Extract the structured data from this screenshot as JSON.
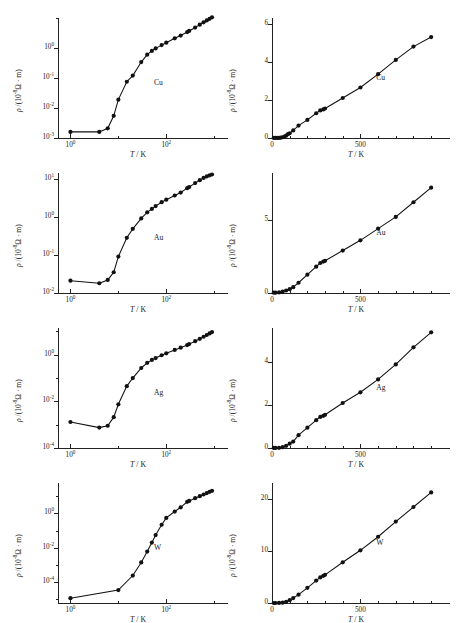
{
  "figure": {
    "caption": "",
    "panel_count": 8,
    "rows": 4,
    "columns": 2
  },
  "axis_titles": {
    "x": "T / K",
    "y_log": "ρ /(10⁻⁸Ω · m)",
    "y_linear": "ρ /(10⁻⁸Ω · m)"
  },
  "chart_data": [
    {
      "type": "line",
      "id": "cu-log",
      "title": "",
      "series_label": "Cu",
      "xlabel": "T / K",
      "ylabel": "ρ /(10⁻⁸Ω · m)",
      "xscale": "log",
      "yscale": "log",
      "xlim": [
        0.55,
        1200
      ],
      "ylim": [
        0.001,
        10
      ],
      "xticks": [
        1,
        100
      ],
      "xticklabels": [
        "10⁰",
        "10²"
      ],
      "yticks": [
        1,
        0.1,
        0.01,
        0.001
      ],
      "yticklabels": [
        "10⁰",
        "10⁻¹",
        "10⁻²",
        "10⁻³"
      ],
      "x": [
        1,
        4,
        6,
        8,
        10,
        15,
        20,
        30,
        40,
        50,
        60,
        80,
        100,
        150,
        200,
        273,
        300,
        400,
        500,
        600,
        700,
        800,
        900
      ],
      "y": [
        0.0016,
        0.0016,
        0.0021,
        0.0055,
        0.019,
        0.075,
        0.12,
        0.34,
        0.6,
        0.8,
        0.97,
        1.25,
        1.5,
        2.1,
        2.6,
        3.4,
        3.7,
        4.8,
        6.0,
        7.2,
        8.3,
        9.4,
        10.5
      ]
    },
    {
      "type": "line",
      "id": "cu-linear",
      "title": "",
      "series_label": "Cu",
      "xlabel": "T / K",
      "ylabel": "ρ /(10⁻⁸Ω · m)",
      "xscale": "linear",
      "yscale": "linear",
      "xlim": [
        0,
        950
      ],
      "ylim": [
        0,
        6.3
      ],
      "xticks": [
        0,
        100,
        200,
        300,
        400,
        500,
        600,
        700,
        800,
        900
      ],
      "xticklabels": [
        "0",
        "",
        "",
        "",
        "",
        "500",
        "",
        "",
        "",
        ""
      ],
      "yticks": [
        0,
        2,
        4,
        6
      ],
      "yticklabels": [
        "0",
        "2",
        "4",
        "6"
      ],
      "x": [
        10,
        20,
        30,
        40,
        50,
        60,
        70,
        80,
        90,
        100,
        120,
        150,
        200,
        250,
        273,
        290,
        300,
        400,
        500,
        600,
        700,
        800,
        900
      ],
      "y": [
        0.002,
        0.002,
        0.003,
        0.006,
        0.019,
        0.04,
        0.08,
        0.12,
        0.2,
        0.25,
        0.4,
        0.65,
        0.95,
        1.3,
        1.45,
        1.5,
        1.55,
        2.1,
        2.65,
        3.35,
        4.1,
        4.8,
        5.3
      ]
    },
    {
      "type": "line",
      "id": "au-log",
      "title": "",
      "series_label": "Au",
      "xlabel": "T / K",
      "ylabel": "ρ /(10⁻⁸Ω · m)",
      "xscale": "log",
      "yscale": "log",
      "xlim": [
        0.55,
        1200
      ],
      "ylim": [
        0.01,
        14
      ],
      "xticks": [
        1,
        100
      ],
      "xticklabels": [
        "10⁰",
        "10²"
      ],
      "yticks": [
        10,
        1,
        0.1,
        0.01
      ],
      "yticklabels": [
        "10¹",
        "10⁰",
        "10⁻¹",
        "10⁻²"
      ],
      "x": [
        1,
        4,
        6,
        8,
        10,
        15,
        20,
        30,
        40,
        50,
        60,
        80,
        100,
        150,
        200,
        273,
        300,
        400,
        500,
        600,
        700,
        800,
        900
      ],
      "y": [
        0.021,
        0.018,
        0.022,
        0.035,
        0.09,
        0.28,
        0.48,
        0.9,
        1.3,
        1.6,
        1.9,
        2.4,
        2.8,
        3.6,
        4.3,
        5.6,
        6.0,
        7.6,
        9.1,
        10.4,
        11.4,
        12.2,
        12.8
      ]
    },
    {
      "type": "line",
      "id": "au-linear",
      "title": "",
      "series_label": "Au",
      "xlabel": "T / K",
      "ylabel": "ρ /(10⁻⁸Ω · m)",
      "xscale": "linear",
      "yscale": "linear",
      "xlim": [
        0,
        950
      ],
      "ylim": [
        0,
        8.2
      ],
      "xticks": [
        0,
        100,
        200,
        300,
        400,
        500,
        600,
        700,
        800,
        900
      ],
      "xticklabels": [
        "0",
        "",
        "",
        "",
        "",
        "500",
        "",
        "",
        "",
        ""
      ],
      "yticks": [
        0,
        5
      ],
      "yticklabels": [
        "0",
        "5"
      ],
      "x": [
        10,
        20,
        40,
        60,
        80,
        100,
        120,
        150,
        200,
        250,
        273,
        290,
        300,
        400,
        500,
        600,
        700,
        800,
        900
      ],
      "y": [
        0.02,
        0.02,
        0.04,
        0.09,
        0.17,
        0.26,
        0.4,
        0.7,
        1.25,
        1.8,
        2.05,
        2.15,
        2.2,
        2.9,
        3.6,
        4.4,
        5.2,
        6.2,
        7.2
      ]
    },
    {
      "type": "line",
      "id": "ag-log",
      "title": "",
      "series_label": "Ag",
      "xlabel": "T / K",
      "ylabel": "ρ /(10⁻⁸Ω · m)",
      "xscale": "log",
      "yscale": "log",
      "xlim": [
        0.55,
        1200
      ],
      "ylim": [
        0.0001,
        14
      ],
      "xticks": [
        1,
        100
      ],
      "xticklabels": [
        "10⁰",
        "10²"
      ],
      "yticks": [
        1,
        0.01,
        0.0001
      ],
      "yticklabels": [
        "10⁰",
        "10⁻²",
        "10⁻⁴"
      ],
      "x": [
        1,
        4,
        6,
        8,
        10,
        15,
        20,
        30,
        40,
        50,
        60,
        80,
        100,
        150,
        200,
        273,
        300,
        400,
        500,
        600,
        700,
        800,
        900
      ],
      "y": [
        0.0013,
        0.00075,
        0.0009,
        0.0021,
        0.0075,
        0.045,
        0.1,
        0.27,
        0.45,
        0.6,
        0.72,
        0.95,
        1.15,
        1.6,
        2.0,
        2.6,
        2.85,
        3.8,
        4.8,
        5.9,
        7.0,
        8.2,
        9.4
      ]
    },
    {
      "type": "line",
      "id": "ag-linear",
      "title": "",
      "series_label": "Ag",
      "xlabel": "T / K",
      "ylabel": "ρ /(10⁻⁸Ω · m)",
      "xscale": "linear",
      "yscale": "linear",
      "xlim": [
        0,
        950
      ],
      "ylim": [
        0,
        5.6
      ],
      "xticks": [
        0,
        100,
        200,
        300,
        400,
        500,
        600,
        700,
        800,
        900
      ],
      "xticklabels": [
        "0",
        "",
        "",
        "",
        "",
        "500",
        "",
        "",
        "",
        ""
      ],
      "yticks": [
        0,
        2,
        4
      ],
      "yticklabels": [
        "0",
        "2",
        "4"
      ],
      "x": [
        10,
        20,
        40,
        60,
        80,
        100,
        120,
        150,
        200,
        250,
        273,
        290,
        300,
        400,
        500,
        600,
        700,
        800,
        900
      ],
      "y": [
        0.002,
        0.002,
        0.01,
        0.04,
        0.1,
        0.2,
        0.3,
        0.6,
        0.95,
        1.3,
        1.45,
        1.5,
        1.55,
        2.1,
        2.6,
        3.2,
        3.9,
        4.7,
        5.4
      ]
    },
    {
      "type": "line",
      "id": "w-log",
      "title": "",
      "series_label": "W",
      "xlabel": "T / K",
      "ylabel": "ρ /(10⁻⁸Ω · m)",
      "xscale": "log",
      "yscale": "log",
      "xlim": [
        0.55,
        1200
      ],
      "ylim": [
        6e-06,
        60
      ],
      "xticks": [
        1,
        100
      ],
      "xticklabels": [
        "10⁰",
        "10²"
      ],
      "yticks": [
        1,
        0.01,
        0.0001
      ],
      "yticklabels": [
        "10⁰",
        "10⁻²",
        "10⁻⁴"
      ],
      "x": [
        1,
        10,
        20,
        30,
        40,
        50,
        60,
        80,
        100,
        150,
        200,
        273,
        300,
        400,
        500,
        600,
        700,
        800,
        900
      ],
      "y": [
        1.15e-05,
        3.4e-05,
        0.00024,
        0.0014,
        0.006,
        0.02,
        0.055,
        0.22,
        0.55,
        1.3,
        2.3,
        4.8,
        5.4,
        7.8,
        10.2,
        12.8,
        15.5,
        18.3,
        21.0
      ]
    },
    {
      "type": "line",
      "id": "w-linear",
      "title": "",
      "series_label": "W",
      "xlabel": "T / K",
      "ylabel": "ρ /(10⁻⁸Ω · m)",
      "xscale": "linear",
      "yscale": "linear",
      "xlim": [
        0,
        950
      ],
      "ylim": [
        0,
        23
      ],
      "xticks": [
        0,
        100,
        200,
        300,
        400,
        500,
        600,
        700,
        800,
        900
      ],
      "xticklabels": [
        "0",
        "",
        "",
        "",
        "",
        "500",
        "",
        "",
        "",
        ""
      ],
      "yticks": [
        0,
        10,
        20
      ],
      "yticklabels": [
        "0",
        "10",
        "20"
      ],
      "x": [
        10,
        20,
        40,
        60,
        80,
        100,
        120,
        150,
        200,
        250,
        273,
        290,
        300,
        400,
        500,
        600,
        700,
        800,
        900
      ],
      "y": [
        0.0,
        0.0,
        0.01,
        0.06,
        0.22,
        0.55,
        0.95,
        1.6,
        2.9,
        4.3,
        4.9,
        5.2,
        5.4,
        7.8,
        10.1,
        12.7,
        15.6,
        18.4,
        21.2
      ]
    }
  ]
}
